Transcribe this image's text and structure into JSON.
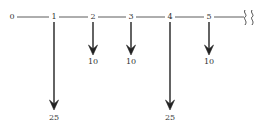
{
  "diagram": {
    "type": "cash-flow-timeline",
    "line_color": "#333333",
    "arrow_color": "#222222",
    "periods": [
      {
        "label": "0",
        "x": 12
      },
      {
        "label": "1",
        "x": 54
      },
      {
        "label": "2",
        "x": 93
      },
      {
        "label": "3",
        "x": 131
      },
      {
        "label": "4",
        "x": 170
      },
      {
        "label": "5",
        "x": 209
      }
    ],
    "break_symbol": "break-icon",
    "cash_flows": [
      {
        "period": "1",
        "amount": "25",
        "direction": "down",
        "x": 54,
        "length": "long"
      },
      {
        "period": "2",
        "amount": "10",
        "direction": "down",
        "x": 93,
        "length": "short"
      },
      {
        "period": "3",
        "amount": "10",
        "direction": "down",
        "x": 131,
        "length": "short"
      },
      {
        "period": "4",
        "amount": "25",
        "direction": "down",
        "x": 170,
        "length": "long"
      },
      {
        "period": "5",
        "amount": "10",
        "direction": "down",
        "x": 209,
        "length": "short"
      }
    ]
  }
}
